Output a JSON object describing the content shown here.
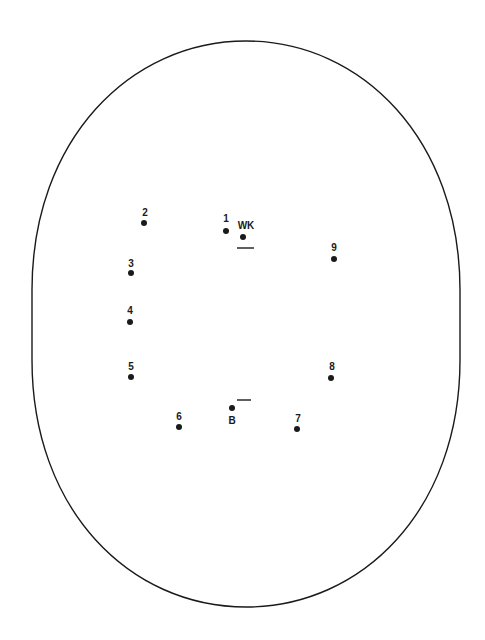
{
  "diagram": {
    "title": "",
    "field_shape": "oval",
    "colors": {
      "line": "#1a1a1a",
      "background": "#ffffff"
    },
    "positions": [
      {
        "id": "1",
        "label": "1",
        "dot": [
          226,
          231
        ],
        "label_pos": [
          226,
          222
        ]
      },
      {
        "id": "wk",
        "label": "WK",
        "dot": [
          243,
          237
        ],
        "label_pos": [
          246,
          229
        ]
      },
      {
        "id": "2",
        "label": "2",
        "dot": [
          144,
          223
        ],
        "label_pos": [
          145,
          216
        ]
      },
      {
        "id": "3",
        "label": "3",
        "dot": [
          131,
          273
        ],
        "label_pos": [
          131,
          267
        ]
      },
      {
        "id": "4",
        "label": "4",
        "dot": [
          130,
          322
        ],
        "label_pos": [
          130,
          314
        ]
      },
      {
        "id": "5",
        "label": "5",
        "dot": [
          131,
          377
        ],
        "label_pos": [
          131,
          370
        ]
      },
      {
        "id": "6",
        "label": "6",
        "dot": [
          179,
          427
        ],
        "label_pos": [
          179,
          420
        ]
      },
      {
        "id": "b",
        "label": "B",
        "dot": [
          232,
          408
        ],
        "label_pos": [
          232,
          424
        ]
      },
      {
        "id": "7",
        "label": "7",
        "dot": [
          297,
          429
        ],
        "label_pos": [
          298,
          422
        ]
      },
      {
        "id": "8",
        "label": "8",
        "dot": [
          331,
          378
        ],
        "label_pos": [
          332,
          370
        ]
      },
      {
        "id": "9",
        "label": "9",
        "dot": [
          334,
          259
        ],
        "label_pos": [
          334,
          251
        ]
      }
    ],
    "creases": [
      {
        "id": "crease-wk",
        "x1": 237,
        "x2": 254,
        "y": 248
      },
      {
        "id": "crease-b",
        "x1": 237,
        "x2": 251,
        "y": 400
      }
    ]
  }
}
